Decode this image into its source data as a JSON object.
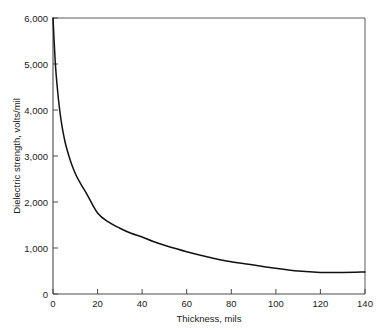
{
  "chart_data": {
    "type": "line",
    "title": "",
    "xlabel": "Thickness, mils",
    "ylabel": "Dielectric strength, volts/mil",
    "xlim": [
      0,
      140
    ],
    "ylim": [
      0,
      6000
    ],
    "grid": false,
    "legend": null,
    "xticks": [
      0,
      20,
      40,
      60,
      80,
      100,
      120,
      140
    ],
    "xtick_labels": [
      "0",
      "20",
      "40",
      "60",
      "80",
      "100",
      "120",
      "140"
    ],
    "yticks": [
      0,
      1000,
      2000,
      3000,
      4000,
      5000,
      6000
    ],
    "ytick_labels": [
      "0",
      "1,000",
      "2,000",
      "3,000",
      "4,000",
      "5,000",
      "6,000"
    ],
    "series": [
      {
        "name": "Dielectric strength vs thickness",
        "color": "#111111",
        "x": [
          0,
          1,
          2,
          3,
          4,
          5,
          6,
          8,
          10,
          12,
          15,
          20,
          25,
          30,
          35,
          40,
          45,
          50,
          60,
          70,
          80,
          90,
          100,
          110,
          120,
          130,
          140
        ],
        "y": [
          6000,
          5050,
          4450,
          4000,
          3660,
          3400,
          3190,
          2870,
          2620,
          2430,
          2190,
          1760,
          1560,
          1430,
          1320,
          1240,
          1140,
          1060,
          920,
          800,
          700,
          630,
          560,
          500,
          470,
          470,
          480
        ]
      }
    ]
  },
  "axis_titles": {
    "x": "Thickness, mils",
    "y": "Dielectric strength, volts/mil"
  },
  "colors": {
    "curve": "#111111",
    "axis": "#4a4a4a",
    "frame": "#5a5a5a",
    "text": "#1a1a1a",
    "background": "#ffffff"
  }
}
